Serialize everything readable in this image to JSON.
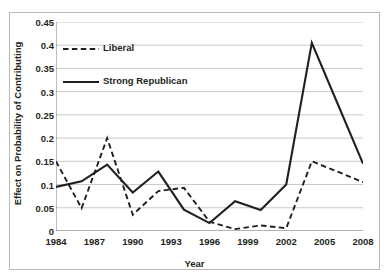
{
  "figure": {
    "title": "",
    "background": "#ffffff",
    "border_color": "#b9b9b9"
  },
  "axes": {
    "ylabel": "Effect on Probability of Contributing",
    "xlabel": "Year",
    "yticks": [
      "0",
      "0.05",
      "0.1",
      "0.15",
      "0.2",
      "0.25",
      "0.3",
      "0.35",
      "0.4",
      "0.45"
    ],
    "xticks": [
      "1984",
      "1987",
      "1990",
      "1993",
      "1996",
      "1999",
      "2002",
      "2005",
      "2008"
    ]
  },
  "legend": {
    "items": [
      {
        "label": "Liberal",
        "style": "dashed",
        "color": "#231f20"
      },
      {
        "label": "Strong Republican",
        "style": "solid",
        "color": "#231f20"
      }
    ]
  },
  "chart_data": {
    "type": "line",
    "title": "",
    "xlabel": "Year",
    "ylabel": "Effect on Probability of Contributing",
    "xlim": [
      1984,
      2008
    ],
    "ylim": [
      0,
      0.45
    ],
    "ytick_values": [
      0,
      0.05,
      0.1,
      0.15,
      0.2,
      0.25,
      0.3,
      0.35,
      0.4,
      0.45
    ],
    "xtick_values": [
      1984,
      1987,
      1990,
      1993,
      1996,
      1999,
      2002,
      2005,
      2008
    ],
    "grid": "horizontal",
    "legend_position": "upper-left-inside",
    "x": [
      1984,
      1986,
      1988,
      1990,
      1992,
      1994,
      1996,
      1998,
      2000,
      2002,
      2004,
      2006,
      2008
    ],
    "series": [
      {
        "name": "Liberal",
        "style": "dashed",
        "color": "#231f20",
        "values": [
          0.15,
          0.049,
          0.2,
          0.035,
          0.086,
          0.093,
          0.02,
          0.004,
          0.012,
          0.006,
          0.15,
          0.128,
          0.105
        ]
      },
      {
        "name": "Strong Republican",
        "style": "solid",
        "color": "#231f20",
        "values": [
          0.095,
          0.107,
          0.143,
          0.083,
          0.128,
          0.046,
          0.017,
          0.064,
          0.045,
          0.1,
          0.405,
          0.275,
          0.145
        ]
      }
    ]
  }
}
